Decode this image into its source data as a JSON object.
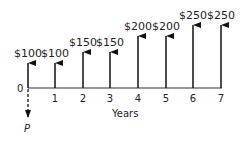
{
  "diagram": {
    "type": "cash-flow",
    "axis_label": "Years",
    "origin_label": "0",
    "present_value_label": "P",
    "flows": [
      {
        "year": 0,
        "tick": "",
        "amount": "$100",
        "top": 63
      },
      {
        "year": 1,
        "tick": "1",
        "amount": "$100",
        "top": 63
      },
      {
        "year": 2,
        "tick": "2",
        "amount": "$150",
        "top": 52
      },
      {
        "year": 3,
        "tick": "3",
        "amount": "$150",
        "top": 52
      },
      {
        "year": 4,
        "tick": "4",
        "amount": "$200",
        "top": 36
      },
      {
        "year": 5,
        "tick": "5",
        "amount": "$200",
        "top": 36
      },
      {
        "year": 6,
        "tick": "6",
        "amount": "$250",
        "top": 25
      },
      {
        "year": 7,
        "tick": "7",
        "amount": "$250",
        "top": 25
      }
    ]
  }
}
